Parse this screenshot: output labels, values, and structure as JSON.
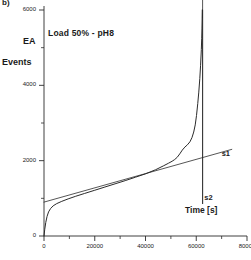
{
  "panel": {
    "label": "b)"
  },
  "chart_data": {
    "type": "line",
    "title": "Load 50% - pH8",
    "xlabel": "Time [s]",
    "ylabel": "EA Events",
    "ylabel_lines": [
      "EA",
      "Events"
    ],
    "xlim": [
      0,
      80000
    ],
    "ylim": [
      0,
      6000
    ],
    "xticks": [
      0,
      20000,
      40000,
      60000,
      80000
    ],
    "xtick_labels": [
      "0",
      "20000",
      "40000",
      "60000",
      "80000"
    ],
    "xminor_step": 10000,
    "yticks": [
      0,
      2000,
      4000,
      6000
    ],
    "ytick_labels": [
      "0",
      "2000",
      "4000",
      "6000"
    ],
    "yminor_step": 1000,
    "grid": false,
    "legend": "none",
    "series": [
      {
        "name": "cumulative-ae-events",
        "kind": "curve",
        "x": [
          0,
          300,
          700,
          1200,
          1800,
          2600,
          3600,
          5000,
          7000,
          9500,
          12500,
          16000,
          20000,
          24000,
          28000,
          32000,
          36000,
          40000,
          44000,
          47000,
          49000,
          50500,
          51500,
          52500,
          53500,
          54500,
          55500,
          56500,
          57500,
          58300,
          59000,
          59600,
          60100,
          60600,
          61000,
          61400,
          61700,
          62000,
          62150,
          62250,
          62320,
          62380,
          62420,
          62450
        ],
        "y": [
          0,
          180,
          360,
          520,
          640,
          730,
          800,
          860,
          920,
          985,
          1055,
          1130,
          1215,
          1300,
          1385,
          1470,
          1560,
          1650,
          1760,
          1860,
          1930,
          1985,
          2030,
          2090,
          2180,
          2280,
          2360,
          2420,
          2500,
          2610,
          2760,
          2950,
          3200,
          3520,
          3820,
          4180,
          4520,
          4950,
          5250,
          5520,
          5760,
          5930,
          6010,
          5800
        ]
      },
      {
        "name": "s1-tangent-line",
        "kind": "line",
        "x": [
          0,
          74000
        ],
        "y": [
          900,
          2300
        ]
      },
      {
        "name": "s2-vertical-line",
        "kind": "vline",
        "x": 62500,
        "y": [
          850,
          6200
        ]
      }
    ],
    "annotations": [
      {
        "name": "s1",
        "text": "s1",
        "x": 70000,
        "y": 2180
      },
      {
        "name": "s2",
        "text": "s2",
        "x": 63200,
        "y": 1020
      }
    ]
  }
}
